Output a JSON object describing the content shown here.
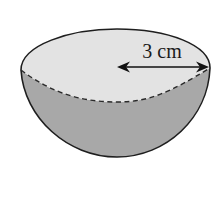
{
  "figure": {
    "type": "hemisphere",
    "radius_label": "3 cm",
    "radius_value": 3,
    "radius_unit": "cm",
    "colors": {
      "top_face": "#e3e3e3",
      "bowl_body": "#a8a8a8",
      "outline": "#1e1e1e",
      "background": "#ffffff"
    }
  }
}
